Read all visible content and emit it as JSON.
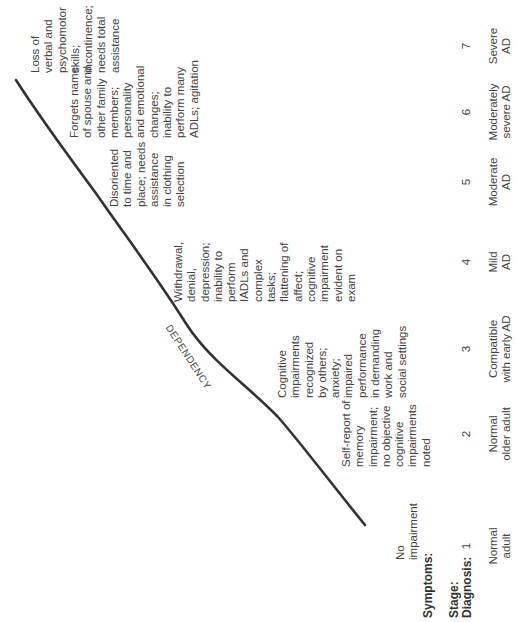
{
  "row_labels": {
    "symptoms": "Symptoms:",
    "stage": "Stage:",
    "diagnosis": "Diagnosis:"
  },
  "curve_label": "DEPENDENCY",
  "stages": [
    {
      "number": "1",
      "diagnosis": "Normal\nadult",
      "symptoms": "No\nimpairment"
    },
    {
      "number": "2",
      "diagnosis": "Normal\nolder adult",
      "symptoms": "Self-report of\nmemory\nimpairment;\nno objective\ncognitive\nimpairments\nnoted"
    },
    {
      "number": "3",
      "diagnosis": "Compatible\nwith early AD",
      "symptoms": "Cognitive\nimpairments\nrecognized\nby others;\nanxiety;\nimpaired\nperformance\nin demanding\nwork and\nsocial settings"
    },
    {
      "number": "4",
      "diagnosis": "Mild\nAD",
      "symptoms": "Withdrawal,\ndenial,\ndepression;\ninability to\nperform\nIADLs and\ncomplex\ntasks;\nflattening of\naffect;\ncognitive\nimpairment\nevident on\nexam"
    },
    {
      "number": "5",
      "diagnosis": "Moderate\nAD",
      "symptoms": "Disoriented\nto time and\nplace; needs\nassistance\nin clothing\nselection"
    },
    {
      "number": "6",
      "diagnosis": "Moderately\nsevere AD",
      "symptoms": "Forgets name\nof spouse and\nother family\nmembers;\npersonality\nand emotional\nchanges;\ninability to\nperform many\nADLs; agitation"
    },
    {
      "number": "7",
      "diagnosis": "Severe\nAD",
      "symptoms": "Loss of\nverbal and\npsychomotor\nskills;\nincontinence;\nneeds total\nassistance"
    }
  ],
  "colors": {
    "curve": "#333333",
    "text": "#444444"
  }
}
